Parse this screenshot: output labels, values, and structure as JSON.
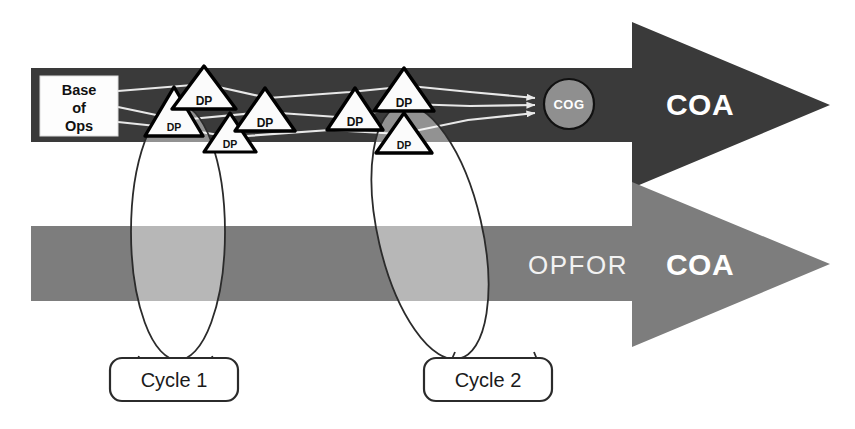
{
  "diagram": {
    "colors": {
      "friendly_band": "#3a3a3a",
      "opfor_band": "#7d7d7d",
      "cycle_overlay": "#ffffff",
      "route_line": "#e8e8e8",
      "cog_fill": "#8f8f8f",
      "triangle_fill": "#fbfbfb",
      "triangle_stroke": "#000000",
      "background": "#ffffff"
    }
  },
  "friendly_arrow": {
    "label": "COA",
    "base_box": {
      "line1": "Base",
      "line2": "of",
      "line3": "Ops"
    },
    "cog": {
      "label": "COG"
    },
    "routes": 3
  },
  "opfor_arrow": {
    "force_label": "OPFOR",
    "label": "COA"
  },
  "decision_points": [
    {
      "id": "dp1",
      "label": "DP"
    },
    {
      "id": "dp2",
      "label": "DP"
    },
    {
      "id": "dp3",
      "label": "DP"
    },
    {
      "id": "dp4",
      "label": "DP"
    },
    {
      "id": "dp5",
      "label": "DP"
    },
    {
      "id": "dp6",
      "label": "DP"
    },
    {
      "id": "dp7",
      "label": "DP"
    }
  ],
  "cycles": [
    {
      "id": "cycle-1",
      "label": "Cycle 1"
    },
    {
      "id": "cycle-2",
      "label": "Cycle 2"
    }
  ]
}
